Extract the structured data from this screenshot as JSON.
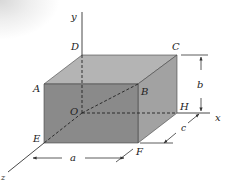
{
  "diagram": {
    "type": "rectangular-box-3d",
    "colors": {
      "front_face": "#8a8a8a",
      "top_face": "#b4b4b4",
      "right_face": "#a2a2a2",
      "edge": "#333333",
      "axis": "#333333",
      "background": "#ffffff"
    },
    "vertices": {
      "A": {
        "label": "A",
        "x": 44,
        "y": 84
      },
      "B": {
        "label": "B",
        "x": 138,
        "y": 84
      },
      "C": {
        "label": "C",
        "x": 177,
        "y": 55
      },
      "D": {
        "label": "D",
        "x": 82,
        "y": 55
      },
      "E": {
        "label": "E",
        "x": 44,
        "y": 143
      },
      "F": {
        "label": "F",
        "x": 138,
        "y": 143
      },
      "H": {
        "label": "H",
        "x": 177,
        "y": 113
      },
      "O": {
        "label": "O",
        "x": 82,
        "y": 113
      }
    },
    "axes": {
      "x": {
        "label": "x"
      },
      "y": {
        "label": "y"
      },
      "z": {
        "label": "z"
      }
    },
    "dimensions": {
      "a": {
        "label": "a"
      },
      "b": {
        "label": "b"
      },
      "c": {
        "label": "c"
      }
    }
  }
}
